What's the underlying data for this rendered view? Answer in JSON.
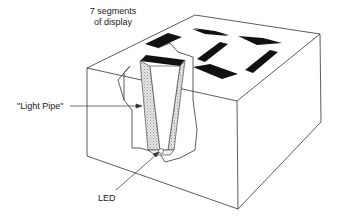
{
  "diagram": {
    "labels": {
      "segments_line1": "7 segments",
      "segments_line2": "of display",
      "light_pipe": "\"Light Pipe\"",
      "led": "LED"
    },
    "colors": {
      "line": "#333333",
      "segment": "#111111",
      "pipe_fill": "#d9d9d9",
      "background": "#ffffff"
    }
  }
}
